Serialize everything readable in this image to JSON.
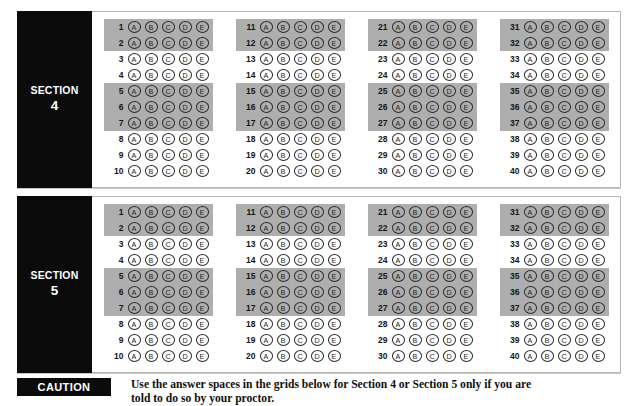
{
  "document": {
    "kind": "answer-sheet",
    "colors": {
      "tab_background": "#0b0b0b",
      "tab_text": "#ffffff",
      "highlight_band": "#aeaeae",
      "page_background": "#ffffff",
      "panel_border": "#b9b9b4"
    }
  },
  "panels": [
    {
      "section_word": "SECTION",
      "section_number": "4",
      "columns": [
        {
          "start": 1,
          "end": 10
        },
        {
          "start": 11,
          "end": 20
        },
        {
          "start": 21,
          "end": 30
        },
        {
          "start": 31,
          "end": 40
        }
      ]
    },
    {
      "section_word": "SECTION",
      "section_number": "5",
      "columns": [
        {
          "start": 1,
          "end": 10
        },
        {
          "start": 11,
          "end": 20
        },
        {
          "start": 21,
          "end": 30
        },
        {
          "start": 31,
          "end": 40
        }
      ]
    }
  ],
  "bubbles": {
    "choices": [
      "A",
      "B",
      "C",
      "D",
      "E"
    ],
    "highlighted_row_offsets": [
      1,
      2,
      5,
      6,
      7
    ]
  },
  "caution": {
    "badge_label": "CAUTION",
    "line1": "Use the answer spaces in the grids below for Section 4 or Section 5 only if you are",
    "line2": "told to do so by your proctor."
  }
}
